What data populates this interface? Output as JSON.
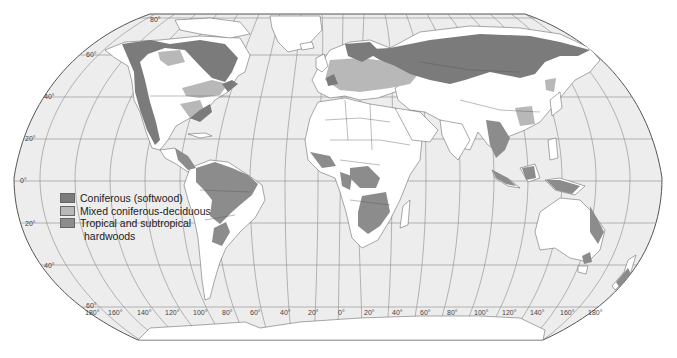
{
  "map": {
    "colors": {
      "ocean": "#ededed",
      "land": "#ffffff",
      "coniferous": "#7b7b7b",
      "mixed": "#b8b8b8",
      "tropical": "#8c8c8c",
      "border": "#555555",
      "graticule": "#8a8a8a"
    },
    "latitude_labels": {
      "n80": "80°",
      "n60": "60°",
      "n40": "40°",
      "n20": "20°",
      "eq": "0°",
      "s20": "20°",
      "s40": "40°",
      "s60": "60°"
    },
    "longitude_labels": [
      "180°",
      "160°",
      "140°",
      "120°",
      "100°",
      "80°",
      "60°",
      "40°",
      "20°",
      "0°",
      "20°",
      "40°",
      "60°",
      "80°",
      "100°",
      "120°",
      "140°",
      "160°",
      "180°"
    ]
  },
  "legend": {
    "items": [
      {
        "label": "Coniferous (softwood)",
        "color": "#7b7b7b"
      },
      {
        "label": "Mixed coniferous-deciduous",
        "color": "#b8b8b8"
      },
      {
        "label": "Tropical and subtropical",
        "color": "#8c8c8c"
      }
    ],
    "continuation": "hardwoods"
  }
}
